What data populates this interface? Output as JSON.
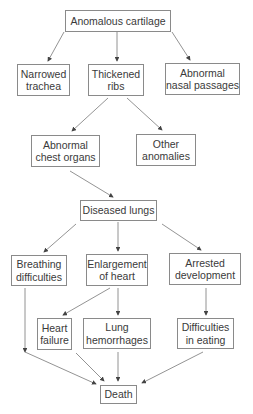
{
  "diagram": {
    "type": "flowchart",
    "nodes": {
      "anomalous_cartilage": "Anomalous cartilage",
      "narrowed_trachea": "Narrowed\ntrachea",
      "thickened_ribs": "Thickened\nribs",
      "abnormal_nasal": "Abnormal\nnasal passages",
      "abnormal_chest": "Abnormal\nchest organs",
      "other_anomalies": "Other\nanomalies",
      "diseased_lungs": "Diseased lungs",
      "breathing": "Breathing\ndifficulties",
      "enlargement_heart": "Enlargement\nof heart",
      "arrested_dev": "Arrested\ndevelopment",
      "heart_failure": "Heart\nfailure",
      "lung_hemorrhages": "Lung\nhemorrhages",
      "difficulties_eating": "Difficulties\nin eating",
      "death": "Death"
    },
    "edges": [
      [
        "anomalous_cartilage",
        "narrowed_trachea"
      ],
      [
        "anomalous_cartilage",
        "thickened_ribs"
      ],
      [
        "anomalous_cartilage",
        "abnormal_nasal"
      ],
      [
        "thickened_ribs",
        "abnormal_chest"
      ],
      [
        "thickened_ribs",
        "other_anomalies"
      ],
      [
        "abnormal_chest",
        "diseased_lungs"
      ],
      [
        "diseased_lungs",
        "breathing"
      ],
      [
        "diseased_lungs",
        "enlargement_heart"
      ],
      [
        "diseased_lungs",
        "arrested_dev"
      ],
      [
        "enlargement_heart",
        "heart_failure"
      ],
      [
        "enlargement_heart",
        "lung_hemorrhages"
      ],
      [
        "arrested_dev",
        "difficulties_eating"
      ],
      [
        "breathing",
        "death"
      ],
      [
        "heart_failure",
        "death"
      ],
      [
        "lung_hemorrhages",
        "death"
      ],
      [
        "difficulties_eating",
        "death"
      ]
    ]
  }
}
